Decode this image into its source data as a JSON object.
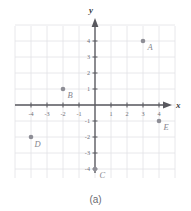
{
  "caption": "(a)",
  "axes": {
    "x_label": "x",
    "y_label": "y",
    "x_tick_labels": [
      "-4",
      "-3",
      "-2",
      "-1",
      "1",
      "2",
      "3",
      "4"
    ],
    "y_tick_labels": [
      "4",
      "3",
      "2",
      "1",
      "-1",
      "-2",
      "-3",
      "-4"
    ]
  },
  "points": [
    {
      "label": "A",
      "x": 3,
      "y": 4
    },
    {
      "label": "B",
      "x": -2,
      "y": 1
    },
    {
      "label": "C",
      "x": 0,
      "y": -4
    },
    {
      "label": "D",
      "x": -4,
      "y": -2
    },
    {
      "label": "E",
      "x": 4,
      "y": -1
    }
  ],
  "colors": {
    "grid": "#e2e2e6",
    "axis": "#58585e",
    "point": "#8e8e96",
    "point_label": "#86868e",
    "tick_label": "#6e6e76",
    "background": "#ffffff"
  },
  "chart_data": {
    "type": "scatter",
    "title": "",
    "subtitle": "",
    "xlabel": "x",
    "ylabel": "y",
    "xlim": [
      -5,
      5
    ],
    "ylim": [
      -5,
      5
    ],
    "xticks": [
      -4,
      -3,
      -2,
      -1,
      1,
      2,
      3,
      4
    ],
    "yticks": [
      4,
      3,
      2,
      1,
      -1,
      -2,
      -3,
      -4
    ],
    "grid": true,
    "legend": "none",
    "annotations": [
      "A",
      "B",
      "C",
      "D",
      "E"
    ],
    "series": [
      {
        "name": "labeled points",
        "points": [
          {
            "label": "A",
            "x": 3,
            "y": 4
          },
          {
            "label": "B",
            "x": -2,
            "y": 1
          },
          {
            "label": "C",
            "x": 0,
            "y": -4
          },
          {
            "label": "D",
            "x": -4,
            "y": -2
          },
          {
            "label": "E",
            "x": 4,
            "y": -1
          }
        ]
      }
    ]
  }
}
